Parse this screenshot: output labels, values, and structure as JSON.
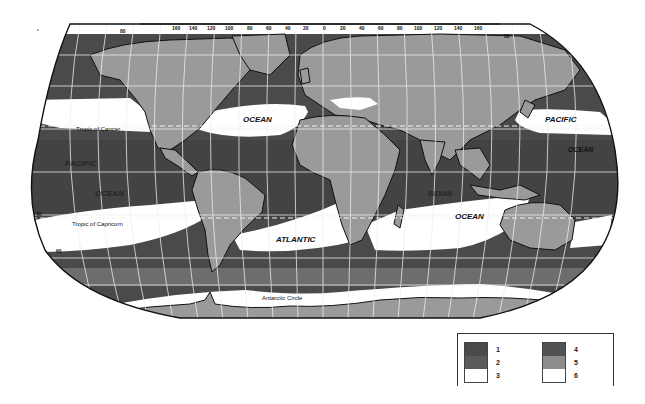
{
  "map": {
    "projection": "Robinson-like world map",
    "longitude_ticks_top": [
      "160",
      "140",
      "120",
      "100",
      "80",
      "60",
      "40",
      "20",
      "0",
      "20",
      "40",
      "60",
      "80",
      "100",
      "120",
      "140",
      "160"
    ],
    "edge_ticks": {
      "top_left": "80",
      "top_right": "80",
      "left_mid_upper": "20",
      "left_lower": "40",
      "left_bottom": "60"
    },
    "labels": {
      "ocean_n_atlantic": "OCEAN",
      "pacific_ne": "PACIFIC",
      "ocean_ne": "OCEAN",
      "pacific_sw": "PACIFIC",
      "ocean_sw": "OCEAN",
      "indian": "INDIAN",
      "ocean_indian": "OCEAN",
      "atlantic": "ATLANTIC",
      "tropic_cancer": "Tropic of Cancer",
      "tropic_capricorn": "Tropic of Capricorn",
      "antarctic_circle": "Antarctic Circle"
    },
    "colors": {
      "class1": "#4a4a4a",
      "class2": "#5c5c5c",
      "class3": "#ffffff",
      "class4": "#555555",
      "class5": "#8a8a8a",
      "class6": "#ffffff",
      "land": "#9a9a9a",
      "border": "#111111",
      "grid": "#e8e8e8"
    }
  },
  "legend": {
    "items": [
      {
        "id": "1",
        "label": "1",
        "color": "#4a4a4a"
      },
      {
        "id": "2",
        "label": "2",
        "color": "#5a5a5a"
      },
      {
        "id": "3",
        "label": "3",
        "color": "#ffffff"
      },
      {
        "id": "4",
        "label": "4",
        "color": "#525252"
      },
      {
        "id": "5",
        "label": "5",
        "color": "#8c8c8c"
      },
      {
        "id": "6",
        "label": "6",
        "color": "#ffffff"
      }
    ]
  }
}
